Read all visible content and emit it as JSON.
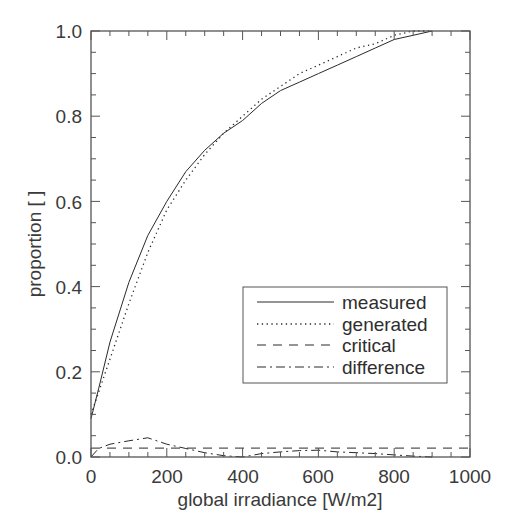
{
  "chart_data": {
    "type": "line",
    "title": "",
    "xlabel": "global irradiance [W/m2]",
    "ylabel": "proportion [ ]",
    "xlim": [
      0,
      1000
    ],
    "ylim": [
      0.0,
      1.0
    ],
    "x_ticks": [
      0,
      200,
      400,
      600,
      800,
      1000
    ],
    "x_tick_labels": [
      "0",
      "200",
      "400",
      "600",
      "800",
      "1000"
    ],
    "y_ticks": [
      0.0,
      0.2,
      0.4,
      0.6,
      0.8,
      1.0
    ],
    "y_tick_labels": [
      "0.0",
      "0.2",
      "0.4",
      "0.6",
      "0.8",
      "1.0"
    ],
    "grid": false,
    "legend_position": "center right",
    "series": [
      {
        "name": "measured",
        "style": "solid",
        "x": [
          0,
          20,
          50,
          100,
          150,
          200,
          250,
          300,
          350,
          400,
          450,
          500,
          550,
          600,
          650,
          700,
          750,
          800,
          850,
          900
        ],
        "values": [
          0.09,
          0.16,
          0.27,
          0.41,
          0.52,
          0.6,
          0.67,
          0.72,
          0.76,
          0.79,
          0.83,
          0.86,
          0.88,
          0.9,
          0.92,
          0.94,
          0.96,
          0.98,
          0.99,
          1.0
        ]
      },
      {
        "name": "generated",
        "style": "dotted",
        "x": [
          0,
          50,
          100,
          150,
          200,
          250,
          300,
          350,
          400,
          450,
          500,
          550,
          600,
          650,
          700,
          750,
          800,
          850,
          900
        ],
        "values": [
          0.1,
          0.23,
          0.36,
          0.48,
          0.58,
          0.65,
          0.71,
          0.76,
          0.8,
          0.84,
          0.87,
          0.9,
          0.92,
          0.94,
          0.96,
          0.97,
          0.99,
          1.0,
          1.0
        ]
      },
      {
        "name": "critical",
        "style": "dashed",
        "x": [
          0,
          1000
        ],
        "values": [
          0.021,
          0.021
        ]
      },
      {
        "name": "difference",
        "style": "dashdot",
        "x": [
          0,
          20,
          50,
          100,
          150,
          200,
          250,
          300,
          350,
          400,
          450,
          500,
          550,
          600,
          650,
          700,
          750,
          800,
          850,
          900
        ],
        "values": [
          0.0,
          0.02,
          0.03,
          0.038,
          0.045,
          0.03,
          0.02,
          0.01,
          0.003,
          0.0,
          0.008,
          0.012,
          0.015,
          0.016,
          0.012,
          0.01,
          0.008,
          0.005,
          0.002,
          0.0
        ]
      }
    ]
  },
  "legend": {
    "items": [
      {
        "label": "measured"
      },
      {
        "label": "generated"
      },
      {
        "label": "critical"
      },
      {
        "label": "difference"
      }
    ]
  },
  "colors": {
    "line": "#2a2a2a",
    "axis": "#555555",
    "text": "#3a3a3a"
  }
}
